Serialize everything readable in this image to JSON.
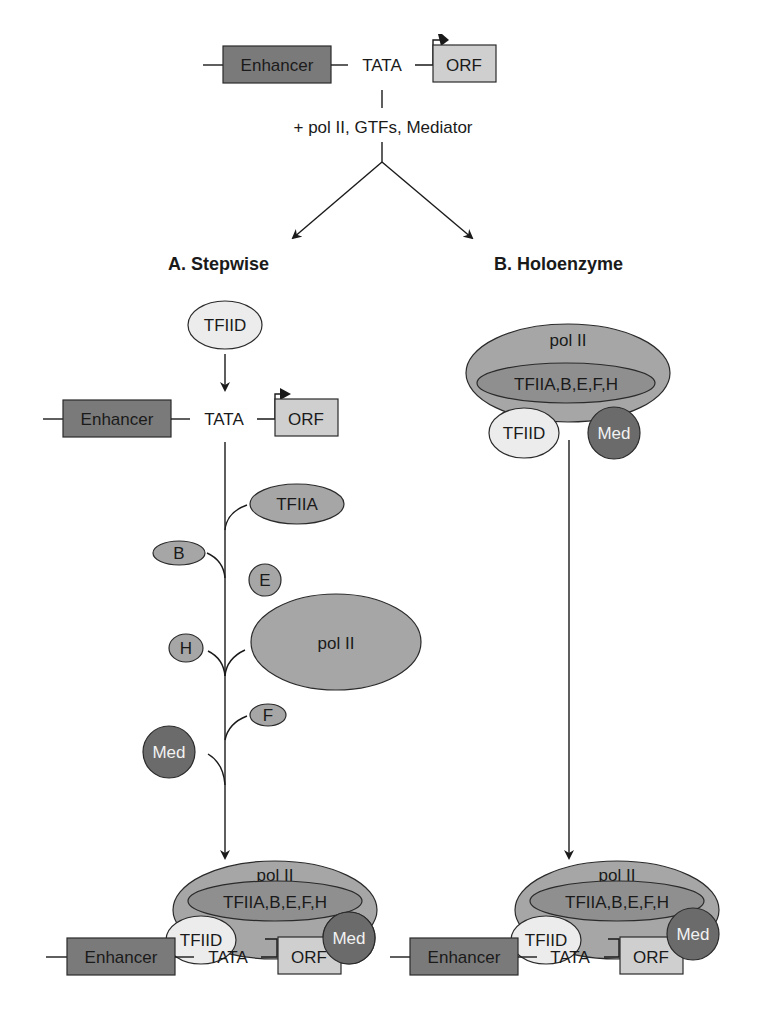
{
  "top_gene": {
    "enhancer": "Enhancer",
    "tata": "TATA",
    "orf": "ORF"
  },
  "step_label": "+ pol II, GTFs, Mediator",
  "branches": {
    "a": {
      "title": "A. Stepwise"
    },
    "b": {
      "title": "B. Holoenzyme"
    }
  },
  "stepwise": {
    "tfiid": "TFIID",
    "gene": {
      "enhancer": "Enhancer",
      "tata": "TATA",
      "orf": "ORF"
    },
    "factors": {
      "tfiia": "TFIIA",
      "b": "B",
      "e": "E",
      "polii": "pol II",
      "h": "H",
      "f": "F",
      "med": "Med"
    },
    "complex": {
      "polii": "pol II",
      "gtfs": "TFIIA,B,E,F,H",
      "tfiid": "TFIID",
      "med": "Med"
    },
    "bottom_gene": {
      "enhancer": "Enhancer",
      "tata": "TATA",
      "orf": "ORF"
    }
  },
  "holoenzyme": {
    "complex": {
      "polii": "pol II",
      "gtfs": "TFIIA,B,E,F,H",
      "tfiid": "TFIID",
      "med": "Med"
    },
    "final_complex": {
      "polii": "pol II",
      "gtfs": "TFIIA,B,E,F,H",
      "tfiid": "TFIID",
      "med": "Med"
    },
    "bottom_gene": {
      "enhancer": "Enhancer",
      "tata": "TATA",
      "orf": "ORF"
    }
  },
  "colors": {
    "enhancer": "#7a7a7a",
    "orf": "#cfcfcf",
    "gtf": "#a6a6a6",
    "tfiid": "#ececec",
    "mediator": "#6b6b6b"
  }
}
